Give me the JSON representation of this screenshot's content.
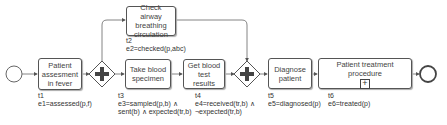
{
  "diagram": {
    "type": "BPMN process",
    "events": {
      "start": {
        "kind": "start-event"
      },
      "end": {
        "kind": "end-event"
      }
    },
    "gateways": [
      {
        "id": "g1",
        "kind": "parallel-split"
      },
      {
        "id": "g2",
        "kind": "parallel-join"
      }
    ],
    "tasks": [
      {
        "id": "t1",
        "text": "Patient assesment in fever",
        "tag": "t1",
        "effect": "e1=assessed(p,f)"
      },
      {
        "id": "t2",
        "text": "Check airway breathing circulation",
        "tag": "t2",
        "effect": "e2=checked(p,abc)"
      },
      {
        "id": "t3",
        "text": "Take blood specimen",
        "tag": "t3",
        "effect_line1": "e3=sampled(p,b) ∧",
        "effect_line2": "sent(b) ∧ expected(tr,b)"
      },
      {
        "id": "t4",
        "text": "Get blood test results",
        "tag": "t4",
        "effect_line1": "e4=received(tr,b) ∧",
        "effect_line2": "¬expected(tr,b)"
      },
      {
        "id": "t5",
        "text": "Diagnose patient",
        "tag": "t5",
        "effect": "e5=diagnosed(p)"
      },
      {
        "id": "t6",
        "text": "Patient treatment procedure",
        "tag": "t6",
        "effect": "e6=treated(p)",
        "subprocess_marker": "+"
      }
    ]
  }
}
